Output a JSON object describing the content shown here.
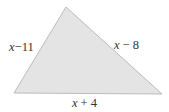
{
  "diagram": {
    "type": "triangle",
    "fill_color": "#e4e4e4",
    "stroke_color": "#bcbcbc",
    "text_color": "#333333",
    "sides": {
      "left": {
        "variable": "x",
        "operator": "−",
        "constant": "11",
        "label": "x − 11"
      },
      "right": {
        "variable": "x",
        "operator": "−",
        "constant": "8",
        "label": "x − 8"
      },
      "bottom": {
        "variable": "x",
        "operator": "+",
        "constant": "4",
        "label": "x + 4"
      }
    }
  }
}
